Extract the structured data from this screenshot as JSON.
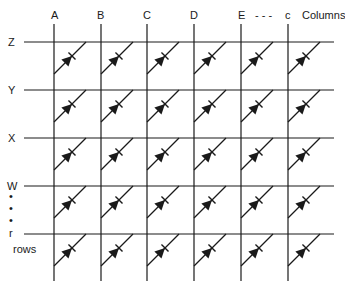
{
  "diagram": {
    "columns": {
      "labels": [
        "A",
        "B",
        "C",
        "D",
        "E",
        "c"
      ],
      "ellipsis": "- - -",
      "caption": "Columns"
    },
    "rows": {
      "labels": [
        "Z",
        "Y",
        "X",
        "W",
        "r"
      ],
      "dots": [
        "•",
        "•",
        "•"
      ],
      "caption": "rows"
    },
    "cell_element": "diode",
    "grid": {
      "cols": 6,
      "rows": 5
    },
    "colors": {
      "line": "#1a1a1a",
      "background": "#ffffff"
    }
  }
}
